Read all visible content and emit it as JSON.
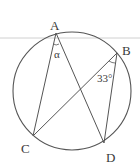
{
  "diagram": {
    "type": "circle-inscribed-angles",
    "colors": {
      "stroke": "#555555",
      "divider": "#bbbbbb",
      "text": "#3a3a3a"
    },
    "circle": {
      "cx": 72,
      "cy": 91,
      "r": 59
    },
    "points": {
      "A": {
        "label": "A",
        "x": 56,
        "y": 33
      },
      "B": {
        "label": "B",
        "x": 117,
        "y": 53
      },
      "C": {
        "label": "C",
        "x": 33,
        "y": 136
      },
      "D": {
        "label": "D",
        "x": 104,
        "y": 143
      }
    },
    "segments": [
      [
        "A",
        "C"
      ],
      [
        "A",
        "D"
      ],
      [
        "B",
        "C"
      ],
      [
        "B",
        "D"
      ]
    ],
    "angles": {
      "at_A": {
        "label": "α",
        "vertex": "A"
      },
      "at_B": {
        "label": "33°",
        "vertex": "B"
      }
    }
  }
}
